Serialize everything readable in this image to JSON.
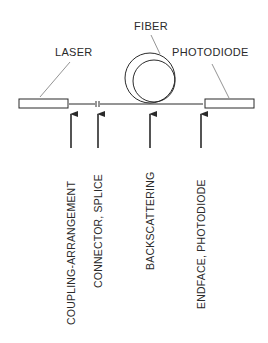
{
  "diagram": {
    "components": {
      "laser": {
        "label": "LASER"
      },
      "fiber": {
        "label": "FIBER"
      },
      "photodiode": {
        "label": "PHOTODIODE"
      }
    },
    "loss_points": [
      {
        "label": "COUPLING-ARRANGEMENT"
      },
      {
        "label": "CONNECTOR, SPLICE"
      },
      {
        "label": "BACKSCATTERING"
      },
      {
        "label": "ENDFACE, PHOTODIODE"
      }
    ],
    "colors": {
      "ink": "#2a2a2a",
      "background": "#ffffff"
    }
  }
}
